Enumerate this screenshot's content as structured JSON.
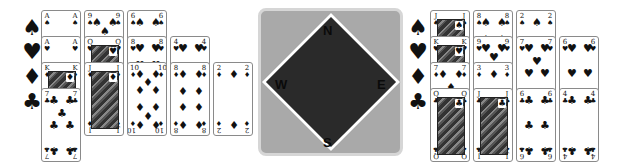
{
  "compass": {
    "north": "N",
    "south": "S",
    "east": "E",
    "west": "W",
    "box_color": "#a9a9a9",
    "diamond_color": "#2a2a2a"
  },
  "west_hand": {
    "suit_icons": [
      {
        "name": "spade",
        "glyph": "♠"
      },
      {
        "name": "heart",
        "glyph": "♥"
      },
      {
        "name": "diamond",
        "glyph": "♦"
      },
      {
        "name": "club",
        "glyph": "♣"
      }
    ],
    "cards": [
      {
        "rank": "A",
        "suit": "♠",
        "col": 0,
        "row": 0
      },
      {
        "rank": "A",
        "suit": "♥",
        "col": 0,
        "row": 1
      },
      {
        "rank": "K",
        "suit": "♦",
        "col": 0,
        "row": 2,
        "face": true
      },
      {
        "rank": "7",
        "suit": "♣",
        "col": 0,
        "row": 3
      },
      {
        "rank": "9",
        "suit": "♠",
        "col": 1,
        "row": 0
      },
      {
        "rank": "Q",
        "suit": "♥",
        "col": 1,
        "row": 1,
        "face": true
      },
      {
        "rank": "J",
        "suit": "♦",
        "col": 1,
        "row": 2,
        "face": true
      },
      {
        "rank": "6",
        "suit": "♠",
        "col": 2,
        "row": 0
      },
      {
        "rank": "8",
        "suit": "♥",
        "col": 2,
        "row": 1
      },
      {
        "rank": "10",
        "suit": "♦",
        "col": 2,
        "row": 2
      },
      {
        "rank": "4",
        "suit": "♥",
        "col": 3,
        "row": 1
      },
      {
        "rank": "8",
        "suit": "♦",
        "col": 3,
        "row": 2
      },
      {
        "rank": "2",
        "suit": "♦",
        "col": 4,
        "row": 2
      }
    ]
  },
  "east_hand": {
    "suit_icons": [
      {
        "name": "spade",
        "glyph": "♠"
      },
      {
        "name": "heart",
        "glyph": "♥"
      },
      {
        "name": "diamond",
        "glyph": "♦"
      },
      {
        "name": "club",
        "glyph": "♣"
      }
    ],
    "cards": [
      {
        "rank": "J",
        "suit": "♠",
        "col": 0,
        "row": 0,
        "face": true
      },
      {
        "rank": "K",
        "suit": "♥",
        "col": 0,
        "row": 1,
        "face": true
      },
      {
        "rank": "7",
        "suit": "♦",
        "col": 0,
        "row": 2
      },
      {
        "rank": "Q",
        "suit": "♣",
        "col": 0,
        "row": 3,
        "face": true
      },
      {
        "rank": "8",
        "suit": "♠",
        "col": 1,
        "row": 0
      },
      {
        "rank": "9",
        "suit": "♥",
        "col": 1,
        "row": 1
      },
      {
        "rank": "3",
        "suit": "♦",
        "col": 1,
        "row": 2
      },
      {
        "rank": "J",
        "suit": "♣",
        "col": 1,
        "row": 3,
        "face": true
      },
      {
        "rank": "2",
        "suit": "♠",
        "col": 2,
        "row": 0
      },
      {
        "rank": "7",
        "suit": "♥",
        "col": 2,
        "row": 1
      },
      {
        "rank": "6",
        "suit": "♣",
        "col": 2,
        "row": 3
      },
      {
        "rank": "6",
        "suit": "♥",
        "col": 3,
        "row": 1
      },
      {
        "rank": "4",
        "suit": "♣",
        "col": 3,
        "row": 3
      }
    ]
  }
}
